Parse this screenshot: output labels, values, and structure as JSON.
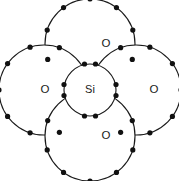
{
  "diagram": {
    "type": "lewis-dot-structure",
    "molecule_formula": "SiO2",
    "molecule_name": "Silicon dioxide",
    "canvas": {
      "width": 179,
      "height": 181,
      "background": "#ffffff"
    },
    "style": {
      "circle_fill": "#ffffff",
      "circle_stroke": "#1a1a1a",
      "circle_stroke_width": 1.15,
      "dot_color": "#111111",
      "dot_radius": 2.6,
      "label_color": "#1a1a1a"
    },
    "central_atom": {
      "symbol": "Si",
      "name": "silicon",
      "cx": 90,
      "cy": 90,
      "r": 26,
      "label_dx": 0,
      "label_dy": 0,
      "label_size": 11
    },
    "outer_atoms": [
      {
        "id": "oxygen-top",
        "symbol": "O",
        "name": "oxygen-top",
        "position": "top",
        "cx": 90,
        "cy": 44,
        "r": 45,
        "label_dx": 16,
        "label_dy": 0,
        "label_size": 11.5
      },
      {
        "id": "oxygen-left",
        "symbol": "O",
        "name": "oxygen-left",
        "position": "left",
        "cx": 44,
        "cy": 90,
        "r": 45,
        "label_dx": 1,
        "label_dy": 0,
        "label_size": 11.5
      },
      {
        "id": "oxygen-right",
        "symbol": "O",
        "name": "oxygen-right",
        "position": "right",
        "cx": 136,
        "cy": 90,
        "r": 45,
        "label_dx": 18,
        "label_dy": 0,
        "label_size": 11.5
      },
      {
        "id": "oxygen-bottom",
        "symbol": "O",
        "name": "oxygen-bottom",
        "position": "bottom",
        "cx": 90,
        "cy": 136,
        "r": 45,
        "label_dx": 16,
        "label_dy": 0,
        "label_size": 11.5
      }
    ],
    "bonding_pairs": [
      {
        "id": "bond-si-o-top",
        "bond": "Si-O top",
        "x": 90,
        "y": 64,
        "orientation": "horizontal",
        "offset": 5.5,
        "electrons": 2
      },
      {
        "id": "bond-si-o-bottom",
        "bond": "Si-O bottom",
        "x": 90,
        "y": 116,
        "orientation": "horizontal",
        "offset": 5.5,
        "electrons": 2
      },
      {
        "id": "bond-si-o-left",
        "bond": "Si-O left",
        "x": 64,
        "y": 90,
        "orientation": "vertical",
        "offset": 5.5,
        "electrons": 2
      },
      {
        "id": "bond-si-o-right",
        "bond": "Si-O right",
        "x": 116,
        "y": 90,
        "orientation": "vertical",
        "offset": 5.5,
        "electrons": 2
      }
    ],
    "lone_pair_dots": [
      {
        "atom": "oxygen-top",
        "cx": 90,
        "cy": 44,
        "r": 45,
        "angles": [
          270,
          306,
          234,
          342,
          198,
          20,
          160
        ]
      },
      {
        "atom": "oxygen-left",
        "cx": 44,
        "cy": 90,
        "r": 45,
        "angles": [
          180,
          216,
          144,
          252,
          108,
          290,
          70
        ]
      },
      {
        "atom": "oxygen-right",
        "cx": 136,
        "cy": 90,
        "r": 45,
        "angles": [
          0,
          324,
          36,
          288,
          72,
          250,
          110
        ]
      },
      {
        "atom": "oxygen-bottom",
        "cx": 90,
        "cy": 136,
        "r": 45,
        "angles": [
          90,
          54,
          126,
          18,
          162,
          340,
          200
        ]
      }
    ],
    "annotations": {
      "total_valence_electrons": 0,
      "description": ""
    }
  }
}
